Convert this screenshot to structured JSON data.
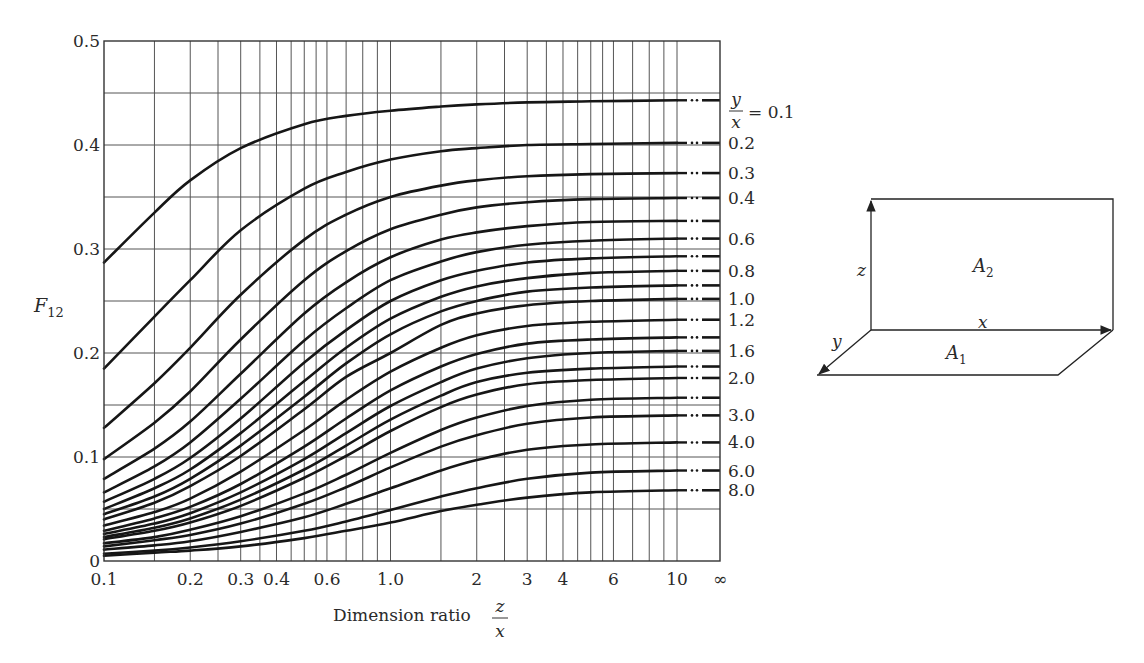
{
  "chart_data": {
    "type": "line",
    "title": "",
    "xlabel": "Dimension ratio z/x",
    "xlabel_text": "Dimension ratio",
    "xlabel_fraction": {
      "numerator": "z",
      "denominator": "x"
    },
    "ylabel": "F12",
    "ylabel_main": "F",
    "ylabel_sub": "12",
    "xscale": "log",
    "xlim": [
      0.1,
      10
    ],
    "x_extension_label": "∞",
    "ylim": [
      0,
      0.5
    ],
    "grid": true,
    "y_ticks": [
      0,
      0.1,
      0.2,
      0.3,
      0.4,
      0.5
    ],
    "y_tick_labels": [
      "0",
      "0.1",
      "0.2",
      "0.3",
      "0.4",
      "0.5"
    ],
    "y_gridlines": [
      0.05,
      0.1,
      0.15,
      0.2,
      0.25,
      0.3,
      0.35,
      0.4,
      0.45
    ],
    "x_tick_labels": [
      {
        "value": 0.1,
        "label": "0.1"
      },
      {
        "value": 0.2,
        "label": "0.2"
      },
      {
        "value": 0.3,
        "label": "0.3"
      },
      {
        "value": 0.4,
        "label": "0.4"
      },
      {
        "value": 0.6,
        "label": "0.6"
      },
      {
        "value": 1.0,
        "label": "1.0"
      },
      {
        "value": 2,
        "label": "2"
      },
      {
        "value": 3,
        "label": "3"
      },
      {
        "value": 4,
        "label": "4"
      },
      {
        "value": 6,
        "label": "6"
      },
      {
        "value": 10,
        "label": "10"
      }
    ],
    "x_gridlines": [
      0.15,
      0.2,
      0.25,
      0.3,
      0.35,
      0.4,
      0.45,
      0.5,
      0.55,
      0.6,
      0.7,
      0.8,
      0.9,
      1.0,
      1.5,
      2,
      2.5,
      3,
      3.5,
      4,
      4.5,
      5,
      5.5,
      6,
      7,
      8,
      9,
      10
    ],
    "parameter_label": {
      "numerator": "y",
      "denominator": "x",
      "suffix": "= 0.1"
    },
    "x": [
      0.1,
      0.15,
      0.2,
      0.3,
      0.5,
      0.7,
      1.0,
      1.5,
      2,
      3,
      5,
      10
    ],
    "series": [
      {
        "name": "y/x = 0.1",
        "label": "0.1",
        "values": [
          0.287,
          0.335,
          0.366,
          0.397,
          0.42,
          0.428,
          0.433,
          0.437,
          0.439,
          0.441,
          0.442,
          0.443
        ]
      },
      {
        "name": "y/x = 0.2",
        "label": "0.2",
        "values": [
          0.185,
          0.235,
          0.27,
          0.318,
          0.358,
          0.374,
          0.386,
          0.394,
          0.397,
          0.4,
          0.401,
          0.402
        ]
      },
      {
        "name": "y/x = 0.3",
        "label": "0.3",
        "values": [
          0.128,
          0.171,
          0.205,
          0.256,
          0.309,
          0.333,
          0.35,
          0.361,
          0.366,
          0.37,
          0.372,
          0.373
        ]
      },
      {
        "name": "y/x = 0.4",
        "label": "0.4",
        "values": [
          0.098,
          0.133,
          0.163,
          0.213,
          0.27,
          0.298,
          0.319,
          0.333,
          0.34,
          0.345,
          0.348,
          0.349
        ]
      },
      {
        "name": "y/x = 0.5",
        "label": "",
        "values": [
          0.079,
          0.108,
          0.134,
          0.18,
          0.238,
          0.268,
          0.292,
          0.309,
          0.316,
          0.322,
          0.326,
          0.327
        ]
      },
      {
        "name": "y/x = 0.6",
        "label": "0.6",
        "values": [
          0.066,
          0.091,
          0.114,
          0.156,
          0.212,
          0.243,
          0.27,
          0.288,
          0.297,
          0.304,
          0.308,
          0.31
        ]
      },
      {
        "name": "y/x = 0.7",
        "label": "",
        "values": [
          0.057,
          0.079,
          0.099,
          0.137,
          0.191,
          0.222,
          0.25,
          0.27,
          0.279,
          0.287,
          0.291,
          0.293
        ]
      },
      {
        "name": "y/x = 0.8",
        "label": "0.8",
        "values": [
          0.05,
          0.07,
          0.088,
          0.123,
          0.173,
          0.205,
          0.233,
          0.254,
          0.264,
          0.272,
          0.277,
          0.279
        ]
      },
      {
        "name": "y/x = 0.9",
        "label": "",
        "values": [
          0.045,
          0.062,
          0.079,
          0.111,
          0.158,
          0.19,
          0.218,
          0.24,
          0.25,
          0.259,
          0.263,
          0.265
        ]
      },
      {
        "name": "y/x = 1.0",
        "label": "1.0",
        "values": [
          0.04,
          0.056,
          0.072,
          0.101,
          0.146,
          0.177,
          0.2,
          0.227,
          0.238,
          0.246,
          0.25,
          0.252
        ]
      },
      {
        "name": "y/x = 1.2",
        "label": "1.2",
        "values": [
          0.034,
          0.047,
          0.06,
          0.086,
          0.126,
          0.155,
          0.182,
          0.205,
          0.217,
          0.226,
          0.23,
          0.232
        ]
      },
      {
        "name": "y/x = 1.4",
        "label": "",
        "values": [
          0.029,
          0.041,
          0.052,
          0.074,
          0.11,
          0.137,
          0.164,
          0.187,
          0.199,
          0.209,
          0.213,
          0.215
        ]
      },
      {
        "name": "y/x = 1.6",
        "label": "1.6",
        "values": [
          0.026,
          0.036,
          0.046,
          0.066,
          0.098,
          0.123,
          0.149,
          0.172,
          0.185,
          0.195,
          0.2,
          0.202
        ]
      },
      {
        "name": "y/x = 1.8",
        "label": "",
        "values": [
          0.023,
          0.032,
          0.041,
          0.059,
          0.088,
          0.111,
          0.136,
          0.159,
          0.172,
          0.181,
          0.185,
          0.187
        ]
      },
      {
        "name": "y/x = 2.0",
        "label": "2.0",
        "values": [
          0.021,
          0.029,
          0.037,
          0.053,
          0.08,
          0.101,
          0.125,
          0.148,
          0.16,
          0.17,
          0.174,
          0.176
        ]
      },
      {
        "name": "y/x = 2.5",
        "label": "",
        "values": [
          0.017,
          0.023,
          0.03,
          0.043,
          0.065,
          0.083,
          0.104,
          0.126,
          0.138,
          0.149,
          0.155,
          0.157
        ]
      },
      {
        "name": "y/x = 3.0",
        "label": "3.0",
        "values": [
          0.014,
          0.02,
          0.025,
          0.036,
          0.055,
          0.071,
          0.09,
          0.11,
          0.121,
          0.132,
          0.138,
          0.14
        ]
      },
      {
        "name": "y/x = 4.0",
        "label": "4.0",
        "values": [
          0.011,
          0.015,
          0.019,
          0.028,
          0.042,
          0.055,
          0.07,
          0.087,
          0.097,
          0.107,
          0.112,
          0.114
        ]
      },
      {
        "name": "y/x = 6.0",
        "label": "6.0",
        "values": [
          0.007,
          0.01,
          0.013,
          0.019,
          0.029,
          0.038,
          0.049,
          0.062,
          0.07,
          0.079,
          0.085,
          0.087
        ]
      },
      {
        "name": "y/x = 8.0",
        "label": "8.0",
        "values": [
          0.005,
          0.008,
          0.01,
          0.014,
          0.022,
          0.029,
          0.037,
          0.048,
          0.054,
          0.061,
          0.066,
          0.068
        ]
      }
    ],
    "inf_extension_values": [
      0.443,
      0.402,
      0.373,
      0.349,
      0.327,
      0.31,
      0.293,
      0.279,
      0.265,
      0.252,
      0.232,
      0.215,
      0.202,
      0.187,
      0.176,
      0.157,
      0.14,
      0.114,
      0.087,
      0.068
    ],
    "legend_position": "right-edge inline labels"
  },
  "diagram": {
    "surface_top_label": "A",
    "surface_top_sub": "2",
    "surface_bottom_label": "A",
    "surface_bottom_sub": "1",
    "axis_x_label": "x",
    "axis_y_label": "y",
    "axis_z_label": "z"
  }
}
